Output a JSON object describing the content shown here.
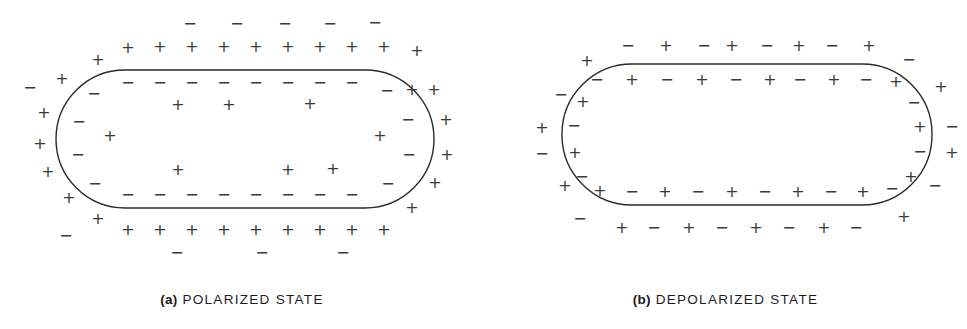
{
  "figure": {
    "background_color": "#ffffff",
    "stroke_color": "#2b2b2b",
    "glyph_color": "#3a3a3a"
  },
  "symbols": {
    "plus": "+",
    "minus": "−"
  },
  "panels": [
    {
      "id": "a",
      "caption_label": "(a)",
      "caption_text": "POLARIZED STATE",
      "cell": {
        "shape": "stadium",
        "x": 56,
        "y": 70,
        "width": 378,
        "height": 138,
        "radius": 69,
        "stroke_width": 1.4
      },
      "charges": {
        "outer_top_far": [
          {
            "s": "minus",
            "x": 190,
            "y": 24
          },
          {
            "s": "minus",
            "x": 237,
            "y": 24
          },
          {
            "s": "minus",
            "x": 285,
            "y": 24
          },
          {
            "s": "minus",
            "x": 330,
            "y": 24
          },
          {
            "s": "minus",
            "x": 375,
            "y": 23
          }
        ],
        "outer_top": [
          {
            "s": "plus",
            "x": 98,
            "y": 60
          },
          {
            "s": "plus",
            "x": 128,
            "y": 48
          },
          {
            "s": "plus",
            "x": 160,
            "y": 47
          },
          {
            "s": "plus",
            "x": 192,
            "y": 47
          },
          {
            "s": "plus",
            "x": 224,
            "y": 47
          },
          {
            "s": "plus",
            "x": 256,
            "y": 47
          },
          {
            "s": "plus",
            "x": 288,
            "y": 47
          },
          {
            "s": "plus",
            "x": 320,
            "y": 47
          },
          {
            "s": "plus",
            "x": 352,
            "y": 47
          },
          {
            "s": "plus",
            "x": 384,
            "y": 47
          },
          {
            "s": "plus",
            "x": 417,
            "y": 51
          }
        ],
        "outer_left": [
          {
            "s": "minus",
            "x": 30,
            "y": 88
          },
          {
            "s": "plus",
            "x": 62,
            "y": 79
          },
          {
            "s": "plus",
            "x": 44,
            "y": 113
          },
          {
            "s": "plus",
            "x": 40,
            "y": 144
          },
          {
            "s": "plus",
            "x": 48,
            "y": 172
          },
          {
            "s": "plus",
            "x": 69,
            "y": 198
          }
        ],
        "outer_right": [
          {
            "s": "plus",
            "x": 412,
            "y": 90
          },
          {
            "s": "plus",
            "x": 434,
            "y": 90
          },
          {
            "s": "plus",
            "x": 446,
            "y": 120
          },
          {
            "s": "plus",
            "x": 447,
            "y": 155
          },
          {
            "s": "plus",
            "x": 435,
            "y": 183
          },
          {
            "s": "plus",
            "x": 412,
            "y": 208
          }
        ],
        "outer_bottom": [
          {
            "s": "plus",
            "x": 98,
            "y": 219
          },
          {
            "s": "plus",
            "x": 128,
            "y": 230
          },
          {
            "s": "plus",
            "x": 160,
            "y": 230
          },
          {
            "s": "plus",
            "x": 192,
            "y": 230
          },
          {
            "s": "plus",
            "x": 224,
            "y": 230
          },
          {
            "s": "plus",
            "x": 256,
            "y": 230
          },
          {
            "s": "plus",
            "x": 288,
            "y": 230
          },
          {
            "s": "plus",
            "x": 320,
            "y": 230
          },
          {
            "s": "plus",
            "x": 352,
            "y": 230
          },
          {
            "s": "plus",
            "x": 384,
            "y": 230
          }
        ],
        "outer_bottom_far": [
          {
            "s": "minus",
            "x": 66,
            "y": 236
          },
          {
            "s": "minus",
            "x": 177,
            "y": 253
          },
          {
            "s": "minus",
            "x": 262,
            "y": 253
          },
          {
            "s": "minus",
            "x": 343,
            "y": 253
          }
        ],
        "inner_top": [
          {
            "s": "minus",
            "x": 128,
            "y": 83
          },
          {
            "s": "minus",
            "x": 160,
            "y": 83
          },
          {
            "s": "minus",
            "x": 192,
            "y": 83
          },
          {
            "s": "minus",
            "x": 224,
            "y": 83
          },
          {
            "s": "minus",
            "x": 256,
            "y": 83
          },
          {
            "s": "minus",
            "x": 288,
            "y": 83
          },
          {
            "s": "minus",
            "x": 320,
            "y": 83
          },
          {
            "s": "minus",
            "x": 352,
            "y": 83
          }
        ],
        "inner_left": [
          {
            "s": "minus",
            "x": 94,
            "y": 94
          },
          {
            "s": "minus",
            "x": 79,
            "y": 122
          },
          {
            "s": "minus",
            "x": 78,
            "y": 155
          },
          {
            "s": "minus",
            "x": 95,
            "y": 184
          }
        ],
        "inner_right": [
          {
            "s": "minus",
            "x": 387,
            "y": 91
          },
          {
            "s": "minus",
            "x": 408,
            "y": 120
          },
          {
            "s": "minus",
            "x": 409,
            "y": 155
          },
          {
            "s": "minus",
            "x": 388,
            "y": 184
          }
        ],
        "inner_bottom": [
          {
            "s": "minus",
            "x": 128,
            "y": 195
          },
          {
            "s": "minus",
            "x": 160,
            "y": 195
          },
          {
            "s": "minus",
            "x": 192,
            "y": 195
          },
          {
            "s": "minus",
            "x": 224,
            "y": 195
          },
          {
            "s": "minus",
            "x": 256,
            "y": 195
          },
          {
            "s": "minus",
            "x": 288,
            "y": 195
          },
          {
            "s": "minus",
            "x": 320,
            "y": 195
          },
          {
            "s": "minus",
            "x": 352,
            "y": 195
          }
        ],
        "cytoplasm": [
          {
            "s": "plus",
            "x": 178,
            "y": 105
          },
          {
            "s": "plus",
            "x": 229,
            "y": 105
          },
          {
            "s": "plus",
            "x": 310,
            "y": 104
          },
          {
            "s": "plus",
            "x": 110,
            "y": 136
          },
          {
            "s": "plus",
            "x": 380,
            "y": 136
          },
          {
            "s": "plus",
            "x": 178,
            "y": 170
          },
          {
            "s": "plus",
            "x": 288,
            "y": 170
          },
          {
            "s": "plus",
            "x": 333,
            "y": 169
          }
        ]
      }
    },
    {
      "id": "b",
      "caption_label": "(b)",
      "caption_text": "DEPOLARIZED STATE",
      "cell": {
        "shape": "stadium",
        "x": 78,
        "y": 64,
        "width": 370,
        "height": 141,
        "radius": 70,
        "stroke_width": 1.4
      },
      "charges": {
        "outer_top": [
          {
            "s": "plus",
            "x": 103,
            "y": 61
          },
          {
            "s": "minus",
            "x": 144,
            "y": 46
          },
          {
            "s": "plus",
            "x": 182,
            "y": 46
          },
          {
            "s": "minus",
            "x": 220,
            "y": 46
          },
          {
            "s": "plus",
            "x": 248,
            "y": 46
          },
          {
            "s": "minus",
            "x": 283,
            "y": 46
          },
          {
            "s": "plus",
            "x": 315,
            "y": 46
          },
          {
            "s": "minus",
            "x": 348,
            "y": 46
          },
          {
            "s": "plus",
            "x": 385,
            "y": 46
          },
          {
            "s": "minus",
            "x": 425,
            "y": 60
          }
        ],
        "outer_left": [
          {
            "s": "minus",
            "x": 77,
            "y": 95
          },
          {
            "s": "plus",
            "x": 58,
            "y": 128
          },
          {
            "s": "minus",
            "x": 58,
            "y": 154
          },
          {
            "s": "plus",
            "x": 81,
            "y": 186
          }
        ],
        "outer_right": [
          {
            "s": "plus",
            "x": 457,
            "y": 87
          },
          {
            "s": "minus",
            "x": 468,
            "y": 127
          },
          {
            "s": "plus",
            "x": 468,
            "y": 153
          },
          {
            "s": "minus",
            "x": 451,
            "y": 186
          }
        ],
        "outer_bottom": [
          {
            "s": "minus",
            "x": 96,
            "y": 219
          },
          {
            "s": "plus",
            "x": 138,
            "y": 228
          },
          {
            "s": "minus",
            "x": 170,
            "y": 228
          },
          {
            "s": "plus",
            "x": 205,
            "y": 228
          },
          {
            "s": "minus",
            "x": 238,
            "y": 228
          },
          {
            "s": "plus",
            "x": 272,
            "y": 228
          },
          {
            "s": "minus",
            "x": 305,
            "y": 228
          },
          {
            "s": "plus",
            "x": 340,
            "y": 228
          },
          {
            "s": "minus",
            "x": 372,
            "y": 228
          },
          {
            "s": "plus",
            "x": 420,
            "y": 217
          }
        ],
        "inner_top": [
          {
            "s": "minus",
            "x": 113,
            "y": 80
          },
          {
            "s": "plus",
            "x": 148,
            "y": 80
          },
          {
            "s": "minus",
            "x": 183,
            "y": 80
          },
          {
            "s": "plus",
            "x": 218,
            "y": 80
          },
          {
            "s": "minus",
            "x": 252,
            "y": 80
          },
          {
            "s": "plus",
            "x": 286,
            "y": 80
          },
          {
            "s": "minus",
            "x": 316,
            "y": 80
          },
          {
            "s": "plus",
            "x": 350,
            "y": 80
          },
          {
            "s": "minus",
            "x": 382,
            "y": 80
          },
          {
            "s": "plus",
            "x": 412,
            "y": 82
          }
        ],
        "inner_left": [
          {
            "s": "plus",
            "x": 99,
            "y": 102
          },
          {
            "s": "minus",
            "x": 90,
            "y": 126
          },
          {
            "s": "plus",
            "x": 91,
            "y": 153
          },
          {
            "s": "minus",
            "x": 98,
            "y": 177
          }
        ],
        "inner_right": [
          {
            "s": "minus",
            "x": 430,
            "y": 103
          },
          {
            "s": "plus",
            "x": 436,
            "y": 127
          },
          {
            "s": "minus",
            "x": 436,
            "y": 152
          },
          {
            "s": "plus",
            "x": 427,
            "y": 177
          }
        ],
        "inner_bottom": [
          {
            "s": "plus",
            "x": 116,
            "y": 191
          },
          {
            "s": "minus",
            "x": 148,
            "y": 192
          },
          {
            "s": "plus",
            "x": 181,
            "y": 192
          },
          {
            "s": "minus",
            "x": 214,
            "y": 192
          },
          {
            "s": "plus",
            "x": 248,
            "y": 192
          },
          {
            "s": "minus",
            "x": 281,
            "y": 192
          },
          {
            "s": "plus",
            "x": 314,
            "y": 192
          },
          {
            "s": "minus",
            "x": 347,
            "y": 192
          },
          {
            "s": "plus",
            "x": 379,
            "y": 192
          },
          {
            "s": "minus",
            "x": 408,
            "y": 189
          }
        ],
        "cytoplasm": []
      }
    }
  ]
}
